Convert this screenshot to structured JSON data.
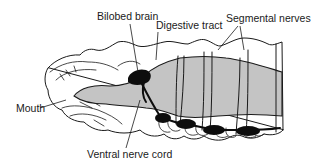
{
  "figure": {
    "labels": {
      "bilobed_brain": "Bilobed brain",
      "digestive_tract": "Digestive tract",
      "segmental_nerves": "Segmental nerves",
      "mouth": "Mouth",
      "ventral_nerve_cord": "Ventral nerve cord"
    },
    "colors": {
      "line": "#1a1a1a",
      "gut_fill": "#c4c4c4",
      "nerve_tissue": "#0d0d0d",
      "background": "#ffffff"
    }
  }
}
